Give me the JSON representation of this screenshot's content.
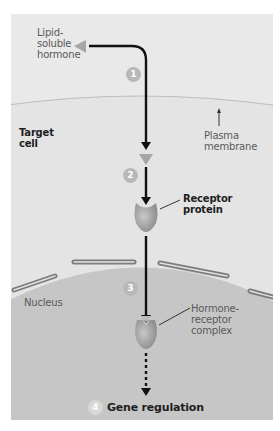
{
  "figure": {
    "title_cropped": "…ing lipid-soluble …",
    "colors": {
      "cytoplasm": "#e6e6e6",
      "nucleus": "#c6c6c6",
      "membrane_line": "#b9b9b9",
      "nuclear_envelope": "#7c7c7c",
      "arrow": "#111111",
      "hormone": "#a6a6a6",
      "receptor": "#9e9e9e",
      "step_badge": "#b8b8b8"
    },
    "labels": {
      "hormone": [
        "Lipid-",
        "soluble",
        "hormone"
      ],
      "target_cell": [
        "Target",
        "cell"
      ],
      "plasma_membrane": [
        "Plasma",
        "membrane"
      ],
      "receptor_protein": [
        "Receptor",
        "protein"
      ],
      "nucleus": "Nucleus",
      "complex": [
        "Hormone-",
        "receptor",
        "complex"
      ],
      "gene_regulation": "Gene regulation"
    },
    "steps": [
      "1",
      "2",
      "3",
      "4"
    ]
  }
}
